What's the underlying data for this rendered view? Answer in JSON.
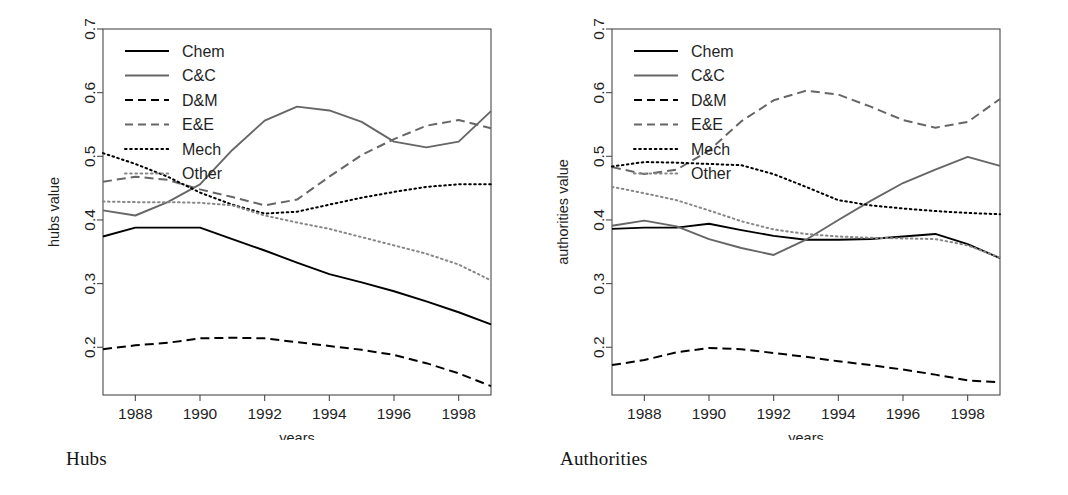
{
  "figure": {
    "panels": [
      {
        "id": "hubs",
        "caption": "Hubs",
        "ylabel": "hubs value",
        "xlabel": "years"
      },
      {
        "id": "authorities",
        "caption": "Authorities",
        "ylabel": "authorities value",
        "xlabel": "years"
      }
    ],
    "legend": {
      "entries": [
        {
          "label": "Chem",
          "style": "solid",
          "color": "#000000"
        },
        {
          "label": "C&C",
          "style": "solid",
          "color": "#666666"
        },
        {
          "label": "D&M",
          "style": "dashed",
          "color": "#000000"
        },
        {
          "label": "E&E",
          "style": "dashed",
          "color": "#666666"
        },
        {
          "label": "Mech",
          "style": "dotted",
          "color": "#000000"
        },
        {
          "label": "Other",
          "style": "dotted",
          "color": "#888888"
        }
      ]
    }
  },
  "chart_data": [
    {
      "type": "line",
      "title": "Hubs",
      "xlabel": "years",
      "ylabel": "hubs value",
      "xlim": [
        1987,
        1999
      ],
      "ylim": [
        0.125,
        0.7
      ],
      "xticks": [
        1988,
        1990,
        1992,
        1994,
        1996,
        1998
      ],
      "yticks": [
        0.2,
        0.3,
        0.4,
        0.5,
        0.6,
        0.7
      ],
      "grid": false,
      "legend_position": "top-left",
      "x": [
        1987,
        1988,
        1989,
        1990,
        1991,
        1992,
        1993,
        1994,
        1995,
        1996,
        1997,
        1998,
        1999
      ],
      "series": [
        {
          "name": "Chem",
          "style": "solid",
          "color": "#000000",
          "values": [
            0.374,
            0.388,
            0.388,
            0.388,
            0.37,
            0.352,
            0.333,
            0.315,
            0.302,
            0.288,
            0.272,
            0.255,
            0.236
          ]
        },
        {
          "name": "C&C",
          "style": "solid",
          "color": "#666666",
          "values": [
            0.415,
            0.407,
            0.428,
            0.456,
            0.51,
            0.556,
            0.578,
            0.572,
            0.554,
            0.523,
            0.514,
            0.523,
            0.571
          ]
        },
        {
          "name": "D&M",
          "style": "dashed",
          "color": "#000000",
          "values": [
            0.197,
            0.203,
            0.207,
            0.214,
            0.215,
            0.214,
            0.208,
            0.202,
            0.196,
            0.188,
            0.175,
            0.159,
            0.139
          ]
        },
        {
          "name": "E&E",
          "style": "dashed",
          "color": "#666666",
          "values": [
            0.46,
            0.468,
            0.463,
            0.448,
            0.436,
            0.423,
            0.432,
            0.468,
            0.502,
            0.527,
            0.548,
            0.557,
            0.544
          ]
        },
        {
          "name": "Mech",
          "style": "dotted",
          "color": "#000000",
          "values": [
            0.505,
            0.488,
            0.468,
            0.443,
            0.424,
            0.41,
            0.413,
            0.424,
            0.435,
            0.444,
            0.452,
            0.456,
            0.456
          ]
        },
        {
          "name": "Other",
          "style": "dotted",
          "color": "#888888",
          "values": [
            0.429,
            0.428,
            0.428,
            0.427,
            0.423,
            0.407,
            0.396,
            0.386,
            0.373,
            0.36,
            0.347,
            0.33,
            0.305
          ]
        }
      ]
    },
    {
      "type": "line",
      "title": "Authorities",
      "xlabel": "years",
      "ylabel": "authorities value",
      "xlim": [
        1987,
        1999
      ],
      "ylim": [
        0.125,
        0.7
      ],
      "xticks": [
        1988,
        1990,
        1992,
        1994,
        1996,
        1998
      ],
      "yticks": [
        0.2,
        0.3,
        0.4,
        0.5,
        0.6,
        0.7
      ],
      "grid": false,
      "legend_position": "top-left",
      "x": [
        1987,
        1988,
        1989,
        1990,
        1991,
        1992,
        1993,
        1994,
        1995,
        1996,
        1997,
        1998,
        1999
      ],
      "series": [
        {
          "name": "Chem",
          "style": "solid",
          "color": "#000000",
          "values": [
            0.386,
            0.388,
            0.388,
            0.394,
            0.384,
            0.375,
            0.369,
            0.369,
            0.37,
            0.374,
            0.378,
            0.362,
            0.34
          ]
        },
        {
          "name": "C&C",
          "style": "solid",
          "color": "#666666",
          "values": [
            0.391,
            0.399,
            0.39,
            0.37,
            0.356,
            0.345,
            0.369,
            0.4,
            0.43,
            0.458,
            0.479,
            0.499,
            0.485
          ]
        },
        {
          "name": "D&M",
          "style": "dashed",
          "color": "#000000",
          "values": [
            0.172,
            0.18,
            0.192,
            0.199,
            0.197,
            0.191,
            0.185,
            0.178,
            0.172,
            0.165,
            0.157,
            0.148,
            0.145
          ]
        },
        {
          "name": "E&E",
          "style": "dashed",
          "color": "#666666",
          "values": [
            0.483,
            0.472,
            0.479,
            0.509,
            0.555,
            0.588,
            0.603,
            0.597,
            0.578,
            0.557,
            0.545,
            0.554,
            0.59
          ]
        },
        {
          "name": "Mech",
          "style": "dotted",
          "color": "#000000",
          "values": [
            0.484,
            0.491,
            0.49,
            0.488,
            0.486,
            0.472,
            0.452,
            0.431,
            0.423,
            0.418,
            0.414,
            0.411,
            0.409
          ]
        },
        {
          "name": "Other",
          "style": "dotted",
          "color": "#888888",
          "values": [
            0.452,
            0.442,
            0.431,
            0.415,
            0.398,
            0.385,
            0.378,
            0.374,
            0.372,
            0.371,
            0.37,
            0.36,
            0.341
          ]
        }
      ]
    }
  ]
}
